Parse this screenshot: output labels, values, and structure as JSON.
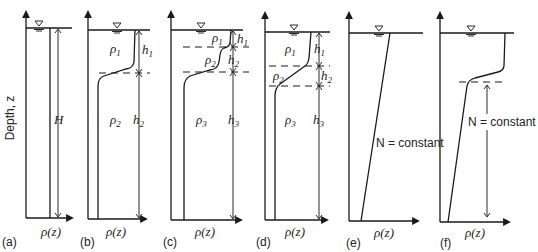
{
  "figure": {
    "y_axis_label": "Depth, z",
    "x_axis_label": "ρ(z)",
    "panels": [
      {
        "id": "a",
        "caption": "(a)",
        "layers": [
          "H"
        ],
        "densities": [],
        "description": "homogeneous"
      },
      {
        "id": "b",
        "caption": "(b)",
        "layers": [
          "h1",
          "h2"
        ],
        "densities": [
          "ρ1",
          "ρ2"
        ],
        "description": "two-layer"
      },
      {
        "id": "c",
        "caption": "(c)",
        "layers": [
          "h1",
          "h2",
          "h3"
        ],
        "densities": [
          "ρ1",
          "ρ2",
          "ρ3"
        ],
        "description": "three-layer, thin top layer"
      },
      {
        "id": "d",
        "caption": "(d)",
        "layers": [
          "h1",
          "h2",
          "h3"
        ],
        "densities": [
          "ρ1",
          "ρ2",
          "ρ3"
        ],
        "description": "three-layer, thin middle layer"
      },
      {
        "id": "e",
        "caption": "(e)",
        "annotation": "N = constant",
        "description": "linear stratification"
      },
      {
        "id": "f",
        "caption": "(f)",
        "annotation": "N = constant",
        "description": "mixed layer over linear stratification"
      }
    ]
  },
  "labels": {
    "H": "H",
    "rho": "ρ",
    "h": "h",
    "n_const": "N = constant",
    "s1": "1",
    "s2": "2",
    "s3": "3",
    "rhoz": "ρ(z)",
    "cap_a": "(a)",
    "cap_b": "(b)",
    "cap_c": "(c)",
    "cap_d": "(d)",
    "cap_e": "(e)",
    "cap_f": "(f)",
    "depth": "Depth, z"
  }
}
